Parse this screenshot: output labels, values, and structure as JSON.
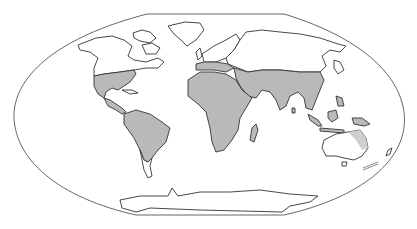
{
  "map": {
    "projection": "flat-polar world projection",
    "colors": {
      "background": "#ffffff",
      "outline": "#555555",
      "coastline": "#333333",
      "highlight_region": "#b9b9b9",
      "unshaded_land": "#ffffff"
    },
    "highlighted_regions": [
      "southern-north-america",
      "central-america",
      "south-america",
      "africa",
      "southern-europe-mediterranean",
      "middle-east",
      "south-asia",
      "southeast-asia",
      "indonesia",
      "northern-australia"
    ],
    "unshaded_regions": [
      "northern-north-america",
      "greenland",
      "northern-europe",
      "northern-asia",
      "southern-australia",
      "patagonia",
      "antarctica"
    ],
    "scale_mark": "scale-mark"
  }
}
